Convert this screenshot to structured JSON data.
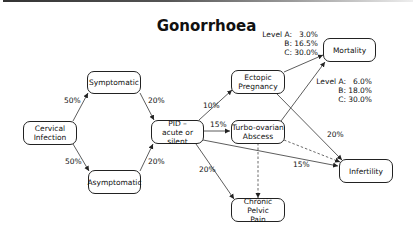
{
  "title": "Gonorrhoea",
  "nodes": {
    "cervical": "Cervical Infection",
    "symptomatic": "Symptomatic",
    "asymptomatic": "Asymptomatic",
    "pid_line1": "PID –",
    "pid_line2": "acute or silent",
    "ectopic_line1": "Ectopic",
    "ectopic_line2": "Pregnancy",
    "tubo_line1": "Turbo-ovarian",
    "tubo_line2": "Abscess",
    "chronic_line1": "Chronic Pelvic",
    "chronic_line2": "Pain",
    "mortality": "Mortality",
    "infertility": "Infertility",
    "cervical_line1": "Cervical",
    "cervical_line2": "Infection"
  },
  "edges": {
    "cervical_to_symptomatic": "50%",
    "cervical_to_asymptomatic": "50%",
    "symptomatic_to_pid": "20%",
    "asymptomatic_to_pid": "20%",
    "pid_to_ectopic": "10%",
    "pid_to_tubo": "15%",
    "pid_to_chronic": "20%",
    "pid_to_infertility": "15%",
    "ectopic_to_infertility": "20%"
  },
  "mortality_levels": {
    "rows": [
      {
        "key": "Level A:",
        "value": "3.0%"
      },
      {
        "key": "B:",
        "value": "16.5%"
      },
      {
        "key": "C:",
        "value": "30.0%"
      }
    ]
  },
  "infertility_levels": {
    "rows": [
      {
        "key": "Level A:",
        "value": "6.0%"
      },
      {
        "key": "B:",
        "value": "18.0%"
      },
      {
        "key": "C:",
        "value": "30.0%"
      }
    ]
  }
}
